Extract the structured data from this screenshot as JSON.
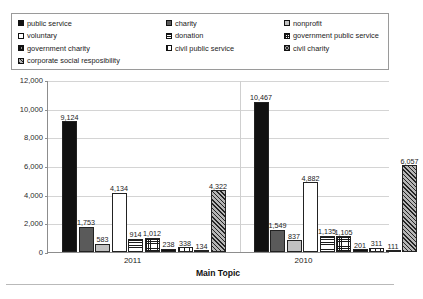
{
  "chart_data": {
    "type": "bar",
    "title": "",
    "xlabel": "Main Topic",
    "ylabel": "",
    "categories": [
      "2011",
      "2010"
    ],
    "ylim": [
      0,
      12000
    ],
    "ytick_labels": [
      "12,000",
      "10,000",
      "8,000",
      "6,000",
      "4,000",
      "2,000",
      "0"
    ],
    "ytick_values": [
      12000,
      10000,
      8000,
      6000,
      4000,
      2000,
      0
    ],
    "grid": true,
    "legend_position": "top",
    "series": [
      {
        "name": "public service",
        "pattern": "solid-black",
        "values": [
          9124,
          10467
        ],
        "labels": [
          "9,124",
          "10,467"
        ]
      },
      {
        "name": "charity",
        "pattern": "dark-gray",
        "values": [
          1753,
          1549
        ],
        "labels": [
          "1,753",
          "1,549"
        ]
      },
      {
        "name": "nonprofit",
        "pattern": "light-gray",
        "values": [
          583,
          837
        ],
        "labels": [
          "583",
          "837"
        ]
      },
      {
        "name": "voluntary",
        "pattern": "white",
        "values": [
          4134,
          4882
        ],
        "labels": [
          "4,134",
          "4,882"
        ]
      },
      {
        "name": "donation",
        "pattern": "hline",
        "values": [
          914,
          1135
        ],
        "labels": [
          "914",
          "1,135"
        ]
      },
      {
        "name": "government public service",
        "pattern": "grid",
        "values": [
          1012,
          1105
        ],
        "labels": [
          "1,012",
          "1,105"
        ]
      },
      {
        "name": "government charity",
        "pattern": "dense-grid",
        "values": [
          238,
          201
        ],
        "labels": [
          "238",
          "201"
        ]
      },
      {
        "name": "civil public service",
        "pattern": "vline",
        "values": [
          338,
          311
        ],
        "labels": [
          "338",
          "311"
        ]
      },
      {
        "name": "civil charity",
        "pattern": "checker",
        "values": [
          134,
          111
        ],
        "labels": [
          "134",
          "111"
        ]
      },
      {
        "name": "corporate social resposibility",
        "pattern": "diag",
        "values": [
          4322,
          6057
        ],
        "labels": [
          "4,322",
          "6,057"
        ]
      }
    ]
  },
  "legend": {
    "items": [
      {
        "label": "public service",
        "pattern": "solid-black"
      },
      {
        "label": "charity",
        "pattern": "dark-gray"
      },
      {
        "label": "nonprofit",
        "pattern": "light-gray"
      },
      {
        "label": "voluntary",
        "pattern": "white"
      },
      {
        "label": "donation",
        "pattern": "hline"
      },
      {
        "label": "government public service",
        "pattern": "grid"
      },
      {
        "label": "government charity",
        "pattern": "dense-grid"
      },
      {
        "label": "civil public service",
        "pattern": "vline"
      },
      {
        "label": "civil charity",
        "pattern": "checker"
      },
      {
        "label": "corporate social resposibility",
        "pattern": "diag"
      }
    ]
  },
  "colors": {
    "axis": "#8d8d8d",
    "gridline": "#d4d4d4",
    "text": "#1a1a1a",
    "legend_border": "#9a9a9a",
    "background": "#ffffff"
  }
}
